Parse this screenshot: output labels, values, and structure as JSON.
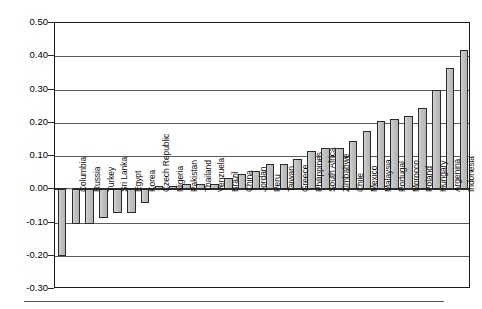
{
  "chart_data": {
    "type": "bar",
    "title": "",
    "subtitle": "",
    "xlabel": "",
    "ylabel": "",
    "ylim": [
      -0.3,
      0.5
    ],
    "ytick_step": 0.1,
    "ytick_labels": [
      "0.50",
      "0.40",
      "0.30",
      "0.20",
      "0.10",
      "0.00",
      "-0.10",
      "-0.20",
      "-0.30"
    ],
    "ytick_values": [
      0.5,
      0.4,
      0.3,
      0.2,
      0.1,
      0.0,
      -0.1,
      -0.2,
      -0.3
    ],
    "grid": true,
    "legend": "none",
    "orientation": "vertical",
    "sorted": "ascending",
    "bar_fill_color": "#bdbdbd",
    "bar_border_color": "#2b2b2b",
    "categories": [
      "India",
      "Columbia",
      "Russia",
      "Turkey",
      "Sri Lanka",
      "Egypt",
      "Korea",
      "Czech Republic",
      "Nigeria",
      "Pakistan",
      "Thailand",
      "Venzuela",
      "Brazil",
      "China",
      "Jordan",
      "Peru",
      "Taiwan",
      "Greece",
      "Philippines",
      "South Africa",
      "Zimbabwe",
      "Chile",
      "Mexico",
      "Malaysia",
      "Portugal",
      "Morocco",
      "Poland",
      "Hungary",
      "Argenina",
      "Indonesia"
    ],
    "values": [
      -0.2,
      -0.105,
      -0.105,
      -0.085,
      -0.072,
      -0.072,
      -0.04,
      0.0,
      0.0,
      0.015,
      0.015,
      0.015,
      0.035,
      0.045,
      0.055,
      0.075,
      0.075,
      0.09,
      0.115,
      0.125,
      0.125,
      0.145,
      0.175,
      0.205,
      0.21,
      0.22,
      0.245,
      0.3,
      0.365,
      0.42
    ],
    "labels_inside_bar": [
      "India"
    ]
  }
}
